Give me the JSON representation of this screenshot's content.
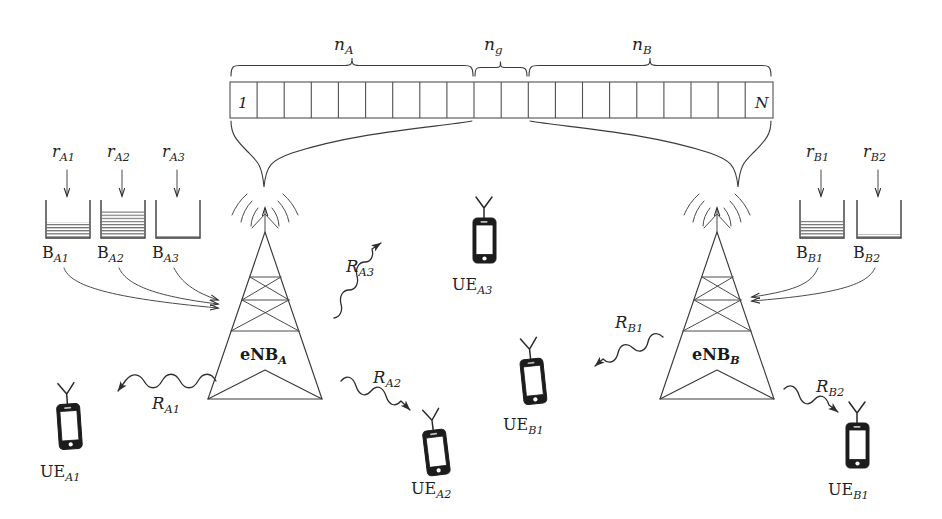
{
  "figure": {
    "type": "network-resource-allocation-diagram"
  },
  "spectrum": {
    "first_block_label": "1",
    "last_block_label": "N",
    "total_blocks": 20,
    "segments": [
      {
        "key": "n_A",
        "base": "n",
        "subscript": "A",
        "blocks": 9,
        "owner": "eNB_A"
      },
      {
        "key": "n_g",
        "base": "n",
        "subscript": "g",
        "blocks": 2,
        "owner": "guard"
      },
      {
        "key": "n_B",
        "base": "n",
        "subscript": "B",
        "blocks": 9,
        "owner": "eNB_B"
      }
    ]
  },
  "base_stations": [
    {
      "id": "enb-a",
      "base": "eNB",
      "subscript": "A"
    },
    {
      "id": "enb-b",
      "base": "eNB",
      "subscript": "B"
    }
  ],
  "buffers_left": [
    {
      "rate_base": "r",
      "rate_sub": "A1",
      "buf_base": "B",
      "buf_sub": "A1",
      "fill_ratio": 0.42
    },
    {
      "rate_base": "r",
      "rate_sub": "A2",
      "buf_base": "B",
      "buf_sub": "A2",
      "fill_ratio": 0.72
    },
    {
      "rate_base": "r",
      "rate_sub": "A3",
      "buf_base": "B",
      "buf_sub": "A3",
      "fill_ratio": 0.04
    }
  ],
  "buffers_right": [
    {
      "rate_base": "r",
      "rate_sub": "B1",
      "buf_base": "B",
      "buf_sub": "B1",
      "fill_ratio": 0.46
    },
    {
      "rate_base": "r",
      "rate_sub": "B2",
      "buf_base": "B",
      "buf_sub": "B2",
      "fill_ratio": 0.08
    }
  ],
  "rates": [
    {
      "base": "R",
      "sub": "A1",
      "from": "eNB_A",
      "to": "UE_A1"
    },
    {
      "base": "R",
      "sub": "A2",
      "from": "eNB_A",
      "to": "UE_A2"
    },
    {
      "base": "R",
      "sub": "A3",
      "from": "eNB_A",
      "to": "UE_A3"
    },
    {
      "base": "R",
      "sub": "B1",
      "from": "eNB_B",
      "to": "UE_B1"
    },
    {
      "base": "R",
      "sub": "B2",
      "from": "eNB_B",
      "to": "UE_B2"
    }
  ],
  "user_equipment": [
    {
      "id": "ue-a1",
      "base": "UE",
      "sub": "A1"
    },
    {
      "id": "ue-a2",
      "base": "UE",
      "sub": "A2"
    },
    {
      "id": "ue-a3",
      "base": "UE",
      "sub": "A3"
    },
    {
      "id": "ue-b1",
      "base": "UE",
      "sub": "B1"
    },
    {
      "id": "ue-b2",
      "base": "UE",
      "sub": "B1"
    }
  ],
  "colors": {
    "ink": "#3a3a3a",
    "ink_dark": "#1c1c1c",
    "paper": "#ffffff"
  }
}
